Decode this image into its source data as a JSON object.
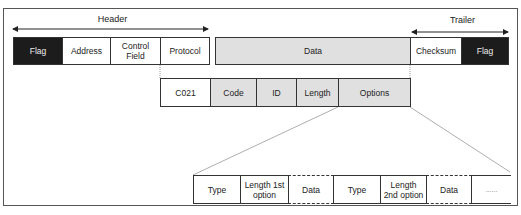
{
  "header_label": "Header",
  "trailer_label": "Trailer",
  "top_row": [
    {
      "label": "Flag",
      "style": "dark"
    },
    {
      "label": "Address",
      "style": "white"
    },
    {
      "label": "Control Field",
      "style": "white"
    },
    {
      "label": "Protocol",
      "style": "white"
    },
    {
      "label": "Data",
      "style": "grey"
    },
    {
      "label": "Checksum",
      "style": "white"
    },
    {
      "label": "Flag",
      "style": "dark"
    }
  ],
  "middle_row": [
    {
      "label": "C021",
      "style": "white"
    },
    {
      "label": "Code",
      "style": "grey"
    },
    {
      "label": "ID",
      "style": "grey"
    },
    {
      "label": "Length",
      "style": "grey"
    },
    {
      "label": "Options",
      "style": "grey"
    }
  ],
  "bottom_row": [
    {
      "label": "Type",
      "style": "white"
    },
    {
      "label": "Length 1st option",
      "style": "white"
    },
    {
      "label": "Data",
      "style": "white",
      "dashed": true
    },
    {
      "label": "Type",
      "style": "white"
    },
    {
      "label": "Length 2nd option",
      "style": "white"
    },
    {
      "label": "Data",
      "style": "white",
      "dashed": true
    },
    {
      "label": "......",
      "style": "white",
      "open": true
    }
  ],
  "colors": {
    "dark": "#1c1c1c",
    "grey": "#e0e0e0",
    "border": "#333333"
  }
}
